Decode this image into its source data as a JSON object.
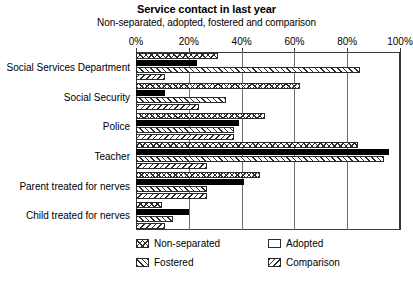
{
  "chart_data": {
    "type": "bar",
    "orientation": "horizontal",
    "title": "Service contact in last year",
    "subtitle": "Non-separated, adopted, fostered and comparison",
    "xlabel": "",
    "ylabel": "",
    "xlim": [
      0,
      100
    ],
    "xticks": [
      0,
      20,
      40,
      60,
      80,
      100
    ],
    "xtick_labels": [
      "0%",
      "20%",
      "40%",
      "60%",
      "80%",
      "100%"
    ],
    "grid": true,
    "legend_position": "bottom",
    "categories": [
      "Social Services Department",
      "Social Security",
      "Police",
      "Teacher",
      "Parent treated for nerves",
      "Child treated for nerves"
    ],
    "series": [
      {
        "name": "Non-separated",
        "pattern": "cross-hatch",
        "values": [
          31,
          62,
          49,
          84,
          47,
          10
        ]
      },
      {
        "name": "Adopted",
        "pattern": "solid-black",
        "values": [
          23,
          11,
          39,
          96,
          41,
          20
        ]
      },
      {
        "name": "Fostered",
        "pattern": "forward-diagonal",
        "values": [
          85,
          34,
          37,
          94,
          27,
          14
        ]
      },
      {
        "name": "Comparison",
        "pattern": "back-diagonal",
        "values": [
          11,
          24,
          37,
          27,
          27,
          11
        ]
      }
    ]
  },
  "legend": {
    "entries": [
      {
        "label": "Non-separated",
        "pattern": "cross-hatch"
      },
      {
        "label": "Adopted",
        "pattern": "solid-black"
      },
      {
        "label": "Fostered",
        "pattern": "forward-diagonal"
      },
      {
        "label": "Comparison",
        "pattern": "back-diagonal"
      }
    ]
  },
  "colors": {
    "ink": "#2b2b2b",
    "background": "#ffffff",
    "grid": "#6e6e6e"
  }
}
